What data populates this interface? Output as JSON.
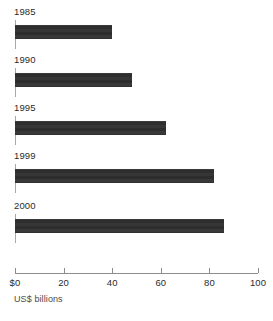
{
  "chart_data": {
    "type": "bar",
    "orientation": "horizontal",
    "title": "",
    "subtitle": "",
    "xlabel": "US$ billions",
    "ylabel": "",
    "categories": [
      "1985",
      "1990",
      "1995",
      "1999",
      "2000"
    ],
    "values": [
      40,
      48,
      62,
      82,
      86
    ],
    "series": [
      {
        "name": "US$ billions",
        "values": [
          40,
          48,
          62,
          82,
          86
        ]
      }
    ],
    "xlim": [
      0,
      100
    ],
    "xticks": [
      0,
      20,
      40,
      60,
      80,
      100
    ],
    "xtick_labels": [
      "$0",
      "20",
      "40",
      "60",
      "80",
      "100"
    ],
    "grid": false,
    "legend": false,
    "legend_position": "none",
    "bar_color": "#333333",
    "axis_color": "#8d8d8d",
    "text_color": "#2b2b2b",
    "background_color": "#ffffff",
    "bars": [
      {
        "label": "1985",
        "value": 40
      },
      {
        "label": "1990",
        "value": 48
      },
      {
        "label": "1995",
        "value": 62
      },
      {
        "label": "1999",
        "value": 82
      },
      {
        "label": "2000",
        "value": 86
      }
    ]
  }
}
